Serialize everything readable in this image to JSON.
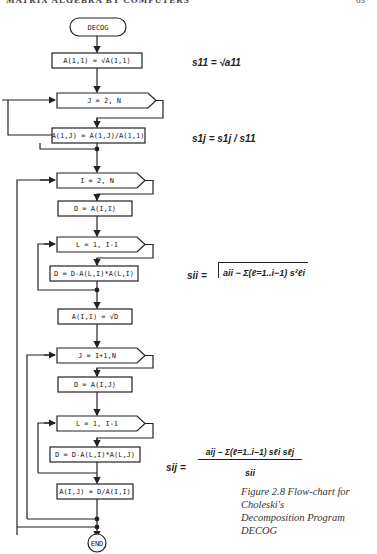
{
  "header": {
    "running_title": "MATRIX ALGEBRA BY COMPUTERS",
    "page_number": "63"
  },
  "flowchart": {
    "start": "DECOG",
    "end": "END",
    "nodes": {
      "n1": "A(1,1) = √A(1,1)",
      "loop1": "J = 2, N",
      "n2": "A(1,J) = A(1,J)/A(1,1)",
      "loop2": "I = 2, N",
      "n3": "D = A(I,I)",
      "loop3": "L = 1, I-1",
      "n4": "D = D-A(L,I)*A(L,I)",
      "n5": "A(I,I) = √D",
      "loop4": "J = I+1,N",
      "n6": "D = A(I,J)",
      "loop5": "L = 1, I-1",
      "n7": "D = D-A(L,I)*A(L,J)",
      "n8": "A(I,J) = D/A(I,I)"
    }
  },
  "formulas": {
    "f1": "s11 = √a11",
    "f2": "s1j = s1j / s11",
    "f3_lhs": "sii =",
    "f3_body": "aii − Σ(ℓ=1..i−1) s²ℓi",
    "f4_lhs": "sij =",
    "f4_num": "aij − Σ(ℓ=1..i−1) sℓi sℓj",
    "f4_den": "sii"
  },
  "caption": {
    "line1": "Figure 2.8    Flow-chart for Choleski's",
    "line2": "Decomposition Program DECOG"
  }
}
